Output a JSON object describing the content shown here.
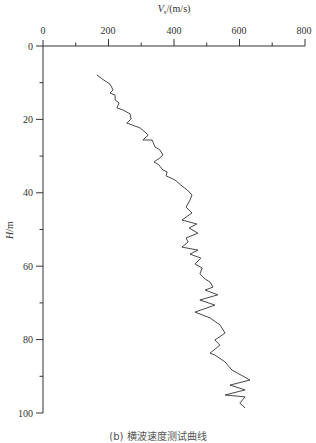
{
  "chart_data": {
    "type": "line",
    "title": "",
    "caption": "(b) 横波速度测试曲线",
    "xlabel": "Vs /(m/s)",
    "ylabel": "H/m",
    "x_axis_position": "top",
    "y_axis_inverted": true,
    "xlim": [
      0,
      800
    ],
    "ylim": [
      0,
      100
    ],
    "x_ticks": [
      0,
      200,
      400,
      600,
      800
    ],
    "x_minor_ticks": [
      100,
      300,
      500,
      700
    ],
    "y_ticks": [
      0,
      20,
      40,
      60,
      80,
      100
    ],
    "y_minor_ticks": [
      10,
      30,
      50,
      70,
      90
    ],
    "grid": false,
    "legend": null,
    "series": [
      {
        "name": "Vs",
        "color": "#333333",
        "points": [
          [
            165,
            7.9
          ],
          [
            186,
            9.3
          ],
          [
            205,
            10.4
          ],
          [
            214,
            12.0
          ],
          [
            205,
            12.8
          ],
          [
            220,
            13.4
          ],
          [
            220,
            14.7
          ],
          [
            232,
            15.5
          ],
          [
            226,
            16.9
          ],
          [
            244,
            17.4
          ],
          [
            266,
            18.5
          ],
          [
            269,
            19.9
          ],
          [
            256,
            21.0
          ],
          [
            296,
            22.3
          ],
          [
            311,
            23.4
          ],
          [
            321,
            24.3
          ],
          [
            305,
            25.6
          ],
          [
            333,
            25.6
          ],
          [
            342,
            27.5
          ],
          [
            357,
            28.3
          ],
          [
            366,
            29.7
          ],
          [
            357,
            30.5
          ],
          [
            339,
            31.6
          ],
          [
            354,
            32.4
          ],
          [
            366,
            33.8
          ],
          [
            379,
            34.3
          ],
          [
            376,
            35.4
          ],
          [
            403,
            36.5
          ],
          [
            421,
            37.9
          ],
          [
            440,
            39.2
          ],
          [
            455,
            40.6
          ],
          [
            449,
            42.0
          ],
          [
            437,
            43.9
          ],
          [
            455,
            45.5
          ],
          [
            424,
            47.4
          ],
          [
            470,
            48.5
          ],
          [
            446,
            49.6
          ],
          [
            473,
            51.0
          ],
          [
            437,
            52.3
          ],
          [
            443,
            53.4
          ],
          [
            424,
            54.8
          ],
          [
            473,
            55.6
          ],
          [
            449,
            56.7
          ],
          [
            482,
            57.8
          ],
          [
            464,
            59.4
          ],
          [
            486,
            60.5
          ],
          [
            479,
            62.1
          ],
          [
            495,
            63.5
          ],
          [
            510,
            64.3
          ],
          [
            519,
            65.7
          ],
          [
            495,
            66.5
          ],
          [
            534,
            67.8
          ],
          [
            479,
            69.2
          ],
          [
            525,
            70.6
          ],
          [
            464,
            72.5
          ],
          [
            510,
            74.1
          ],
          [
            540,
            76.0
          ],
          [
            556,
            78.2
          ],
          [
            525,
            80.1
          ],
          [
            540,
            81.5
          ],
          [
            510,
            83.7
          ],
          [
            525,
            84.2
          ],
          [
            556,
            86.1
          ],
          [
            577,
            88.3
          ],
          [
            632,
            91.0
          ],
          [
            571,
            92.4
          ],
          [
            617,
            93.7
          ],
          [
            556,
            95.1
          ],
          [
            617,
            95.6
          ],
          [
            601,
            97.3
          ],
          [
            617,
            98.6
          ]
        ]
      }
    ]
  },
  "labels": {
    "x_title_main": "V",
    "x_title_sub": "s",
    "x_title_unit": "/(m/s)",
    "y_title_main": "H",
    "y_title_unit": "/m",
    "x_tick_0": "0",
    "x_tick_200": "200",
    "x_tick_400": "400",
    "x_tick_600": "600",
    "x_tick_800": "800",
    "y_tick_0": "0",
    "y_tick_20": "20",
    "y_tick_40": "40",
    "y_tick_60": "60",
    "y_tick_80": "80",
    "y_tick_100": "100",
    "caption": "(b) 横波速度测试曲线"
  }
}
